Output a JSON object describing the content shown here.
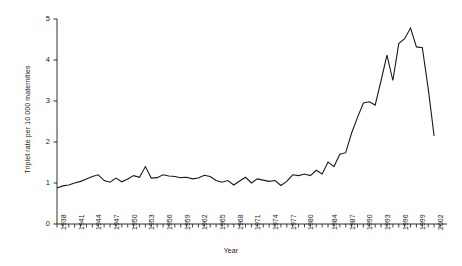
{
  "chart_data": {
    "type": "line",
    "title": "",
    "xlabel": "Year",
    "ylabel": "Triplet rate per 10 000 maternities",
    "xlim": [
      1938,
      2003
    ],
    "ylim": [
      0,
      5
    ],
    "grid": false,
    "legend": null,
    "ytick_labels": [
      "0",
      "1",
      "2",
      "3",
      "4",
      "5"
    ],
    "ytick_values": [
      0,
      1,
      2,
      3,
      4,
      5
    ],
    "xtick_labels": [
      "1938",
      "1941",
      "1944",
      "1947",
      "1950",
      "1953",
      "1956",
      "1959",
      "1962",
      "1965",
      "1968",
      "1971",
      "1974",
      "1977",
      "1980",
      "1984",
      "1987",
      "1990",
      "1993",
      "1996",
      "1999",
      "2002"
    ],
    "xtick_values": [
      1938,
      1941,
      1944,
      1947,
      1950,
      1953,
      1956,
      1959,
      1962,
      1965,
      1968,
      1971,
      1974,
      1977,
      1980,
      1984,
      1987,
      1990,
      1993,
      1996,
      1999,
      2002
    ],
    "line_color": "#1a1a1a",
    "series": [
      {
        "name": "Triplet rate",
        "x": [
          1938,
          1939,
          1940,
          1941,
          1942,
          1943,
          1944,
          1945,
          1946,
          1947,
          1948,
          1949,
          1950,
          1951,
          1952,
          1953,
          1954,
          1955,
          1956,
          1957,
          1958,
          1959,
          1960,
          1961,
          1962,
          1963,
          1964,
          1965,
          1966,
          1967,
          1968,
          1969,
          1970,
          1971,
          1972,
          1973,
          1974,
          1975,
          1976,
          1977,
          1978,
          1979,
          1980,
          1981,
          1982,
          1983,
          1984,
          1985,
          1986,
          1987,
          1988,
          1989,
          1990,
          1991,
          1992,
          1993,
          1994,
          1995,
          1996,
          1997,
          1998,
          1999,
          2000,
          2001,
          2002
        ],
        "y": [
          0.88,
          0.93,
          0.95,
          1.0,
          1.04,
          1.1,
          1.16,
          1.2,
          1.06,
          1.02,
          1.12,
          1.03,
          1.1,
          1.18,
          1.14,
          1.4,
          1.12,
          1.13,
          1.2,
          1.17,
          1.16,
          1.13,
          1.14,
          1.1,
          1.12,
          1.19,
          1.16,
          1.06,
          1.02,
          1.06,
          0.95,
          1.05,
          1.14,
          1.0,
          1.1,
          1.07,
          1.04,
          1.06,
          0.94,
          1.04,
          1.2,
          1.18,
          1.22,
          1.18,
          1.31,
          1.22,
          1.51,
          1.4,
          1.7,
          1.74,
          2.22,
          2.6,
          2.95,
          2.98,
          2.9,
          3.5,
          4.12,
          3.5,
          4.4,
          4.52,
          4.78,
          4.32,
          4.3,
          3.3,
          2.15
        ]
      }
    ]
  }
}
